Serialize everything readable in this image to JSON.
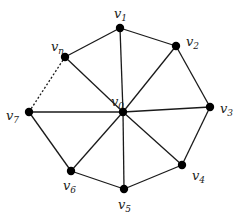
{
  "diagram": {
    "type": "wheel-graph",
    "colors": {
      "edge": "#1a1a1a",
      "node": "#000000",
      "label": "#222222"
    },
    "nodes": [
      {
        "id": "v0",
        "base": "v",
        "sub": "0",
        "x": 123,
        "y": 112,
        "lx": 111,
        "ly": 106
      },
      {
        "id": "v1",
        "base": "v",
        "sub": "1",
        "x": 120,
        "y": 28,
        "lx": 114,
        "ly": 18
      },
      {
        "id": "v2",
        "base": "v",
        "sub": "2",
        "x": 176,
        "y": 46,
        "lx": 186,
        "ly": 46
      },
      {
        "id": "v3",
        "base": "v",
        "sub": "3",
        "x": 210,
        "y": 107,
        "lx": 220,
        "ly": 113
      },
      {
        "id": "v4",
        "base": "v",
        "sub": "4",
        "x": 182,
        "y": 165,
        "lx": 192,
        "ly": 180
      },
      {
        "id": "v5",
        "base": "v",
        "sub": "5",
        "x": 124,
        "y": 189,
        "lx": 118,
        "ly": 209
      },
      {
        "id": "v6",
        "base": "v",
        "sub": "6",
        "x": 71,
        "y": 171,
        "lx": 63,
        "ly": 190
      },
      {
        "id": "v7",
        "base": "v",
        "sub": "7",
        "x": 29,
        "y": 112,
        "lx": 6,
        "ly": 120
      },
      {
        "id": "vn",
        "base": "v",
        "sub": "n",
        "x": 65,
        "y": 57,
        "lx": 51,
        "ly": 51
      }
    ],
    "edges": [
      {
        "from": "v0",
        "to": "v1",
        "style": "solid"
      },
      {
        "from": "v0",
        "to": "v2",
        "style": "solid"
      },
      {
        "from": "v0",
        "to": "v3",
        "style": "solid"
      },
      {
        "from": "v0",
        "to": "v4",
        "style": "solid"
      },
      {
        "from": "v0",
        "to": "v5",
        "style": "solid"
      },
      {
        "from": "v0",
        "to": "v6",
        "style": "solid"
      },
      {
        "from": "v0",
        "to": "v7",
        "style": "solid"
      },
      {
        "from": "v0",
        "to": "vn",
        "style": "solid"
      },
      {
        "from": "v1",
        "to": "v2",
        "style": "solid"
      },
      {
        "from": "v2",
        "to": "v3",
        "style": "solid"
      },
      {
        "from": "v3",
        "to": "v4",
        "style": "solid"
      },
      {
        "from": "v4",
        "to": "v5",
        "style": "solid"
      },
      {
        "from": "v5",
        "to": "v6",
        "style": "solid"
      },
      {
        "from": "v6",
        "to": "v7",
        "style": "solid"
      },
      {
        "from": "v7",
        "to": "vn",
        "style": "dashed"
      },
      {
        "from": "vn",
        "to": "v1",
        "style": "solid"
      }
    ]
  }
}
